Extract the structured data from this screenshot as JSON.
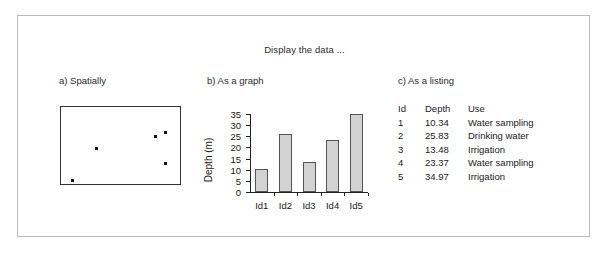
{
  "figure": {
    "title": "Display the data  ...",
    "panels": {
      "a_heading": "a) Spatially",
      "b_heading": "b) As a graph",
      "c_heading": "c) As a listing"
    }
  },
  "spatial": {
    "points": [
      {
        "id": "1",
        "x_pct": 10.0,
        "y_pct": 95.0
      },
      {
        "id": "2",
        "x_pct": 79.0,
        "y_pct": 38.0
      },
      {
        "id": "3",
        "x_pct": 88.0,
        "y_pct": 73.0
      },
      {
        "id": "4",
        "x_pct": 30.0,
        "y_pct": 54.5
      },
      {
        "id": "5",
        "x_pct": 88.0,
        "y_pct": 33.0
      }
    ]
  },
  "chart_data": {
    "type": "bar",
    "title": "",
    "xlabel": "",
    "ylabel": "Depth (m)",
    "categories": [
      "Id1",
      "Id2",
      "Id3",
      "Id4",
      "Id5"
    ],
    "values": [
      10.34,
      25.83,
      13.48,
      23.37,
      34.97
    ],
    "ylim": [
      0,
      35
    ],
    "yticks": [
      0,
      5,
      10,
      15,
      20,
      25,
      30,
      35
    ],
    "ytick_labels": [
      "0",
      "5",
      "10",
      "15",
      "20",
      "25",
      "30",
      "35"
    ],
    "grid": false,
    "legend": null,
    "bar_color": "#d2d2d2",
    "bar_edge_color": "#555555"
  },
  "listing": {
    "columns": [
      "Id",
      "Depth",
      "Use"
    ],
    "rows": [
      {
        "id": "1",
        "depth": "10.34",
        "use": "Water sampling"
      },
      {
        "id": "2",
        "depth": "25.83",
        "use": "Drinking water"
      },
      {
        "id": "3",
        "depth": "13.48",
        "use": "Irrigation"
      },
      {
        "id": "4",
        "depth": "23.37",
        "use": "Water sampling"
      },
      {
        "id": "5",
        "depth": "34.97",
        "use": "Irrigation"
      }
    ]
  },
  "colors": {
    "frame_border": "#b9b9b9",
    "text": "#1a1a1a",
    "axis": "#222222"
  }
}
